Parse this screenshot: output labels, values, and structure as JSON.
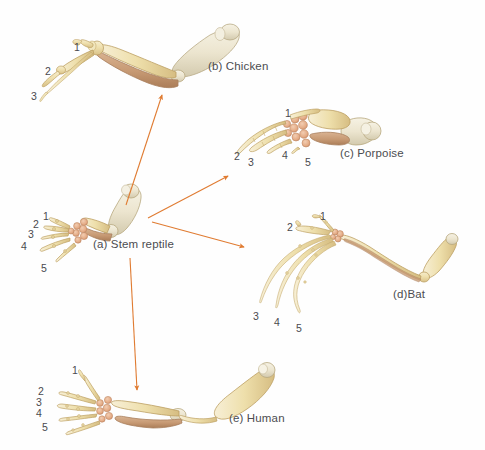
{
  "figure": {
    "background_color": "#fefefe",
    "arrow_color": "#e07b31",
    "label_color": "#4a4a4e",
    "bone_fill": "#f0e3b8",
    "bone_fill_pale": "#ece5d2",
    "bone_fill_brown": "#c9a078",
    "bone_outline": "#b99a5e",
    "carpal_fill": "#e8b99a"
  },
  "panels": [
    {
      "id": "stem-reptile",
      "caption": "(a) Stem reptile",
      "caption_x": 93,
      "caption_y": 238,
      "digits": [
        {
          "label": "1",
          "x": 43,
          "y": 210
        },
        {
          "label": "2",
          "x": 33,
          "y": 218
        },
        {
          "label": "3",
          "x": 28,
          "y": 228
        },
        {
          "label": "4",
          "x": 21,
          "y": 240
        },
        {
          "label": "5",
          "x": 41,
          "y": 262
        }
      ]
    },
    {
      "id": "chicken",
      "caption": "(b) Chicken",
      "caption_x": 208,
      "caption_y": 60,
      "digits": [
        {
          "label": "1",
          "x": 74,
          "y": 41
        },
        {
          "label": "2",
          "x": 45,
          "y": 65
        },
        {
          "label": "3",
          "x": 31,
          "y": 90
        }
      ]
    },
    {
      "id": "porpoise",
      "caption": "(c) Porpoise",
      "caption_x": 340,
      "caption_y": 147,
      "digits": [
        {
          "label": "1",
          "x": 285,
          "y": 107
        },
        {
          "label": "2",
          "x": 234,
          "y": 150
        },
        {
          "label": "3",
          "x": 248,
          "y": 156
        },
        {
          "label": "4",
          "x": 282,
          "y": 149
        },
        {
          "label": "5",
          "x": 305,
          "y": 156
        }
      ]
    },
    {
      "id": "bat",
      "caption": "(d)Bat",
      "caption_x": 393,
      "caption_y": 288,
      "digits": [
        {
          "label": "1",
          "x": 320,
          "y": 210
        },
        {
          "label": "2",
          "x": 287,
          "y": 221
        },
        {
          "label": "3",
          "x": 253,
          "y": 310
        },
        {
          "label": "4",
          "x": 274,
          "y": 316
        },
        {
          "label": "5",
          "x": 296,
          "y": 322
        }
      ]
    },
    {
      "id": "human",
      "caption": "(e) Human",
      "caption_x": 229,
      "caption_y": 412,
      "digits": [
        {
          "label": "1",
          "x": 72,
          "y": 364
        },
        {
          "label": "2",
          "x": 38,
          "y": 385
        },
        {
          "label": "3",
          "x": 36,
          "y": 396
        },
        {
          "label": "4",
          "x": 36,
          "y": 407
        },
        {
          "label": "5",
          "x": 42,
          "y": 421
        }
      ]
    }
  ],
  "arrows": [
    {
      "id": "arrow-to-chicken",
      "from_panel": "stem-reptile",
      "to_panel": "chicken",
      "x1": 126,
      "y1": 205,
      "x2": 162,
      "y2": 95
    },
    {
      "id": "arrow-to-porpoise",
      "from_panel": "stem-reptile",
      "to_panel": "porpoise",
      "x1": 148,
      "y1": 218,
      "x2": 228,
      "y2": 176
    },
    {
      "id": "arrow-to-bat",
      "from_panel": "stem-reptile",
      "to_panel": "bat",
      "x1": 152,
      "y1": 222,
      "x2": 244,
      "y2": 247
    },
    {
      "id": "arrow-to-human",
      "from_panel": "stem-reptile",
      "to_panel": "human",
      "x1": 130,
      "y1": 258,
      "x2": 137,
      "y2": 390
    }
  ]
}
